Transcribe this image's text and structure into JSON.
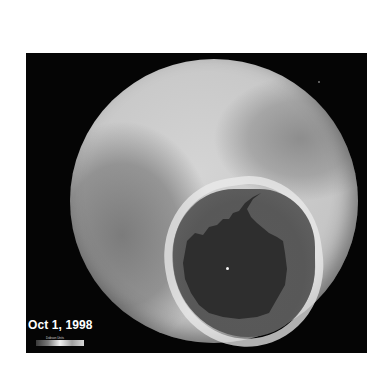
{
  "image": {
    "subject": "Antarctic ozone hole satellite map",
    "date_label": "Oct 1, 1998",
    "colorbar": {
      "title": "Dobson Units",
      "ticks": [
        "",
        "",
        "",
        "",
        ""
      ]
    },
    "colors": {
      "background": "#ffffff",
      "frame": "#050505",
      "globe_light": "#d4d4d4",
      "globe_mid": "#a6a6a6",
      "hole": "#5a5a5a",
      "continent": "#2e2e2e",
      "collar": "#ebebeb"
    }
  }
}
